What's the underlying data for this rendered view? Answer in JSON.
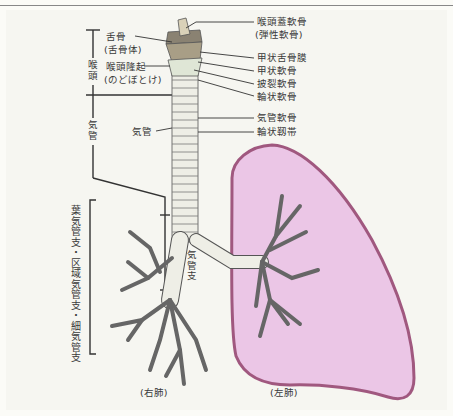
{
  "figure": {
    "colors": {
      "background": "#f6f6f1",
      "lung_fill": "#ebc6e6",
      "lung_outline": "#a0587f",
      "cartilage": "#f2f2ec",
      "cartilage_shade": "#c9c5b4",
      "line": "#333333"
    }
  },
  "labels": {
    "right_side": {
      "epiglottic_cartilage": "喉頭蓋軟骨",
      "epiglottic_cartilage_note": "(弾性軟骨)",
      "thyrohyoid_membrane": "甲状舌骨膜",
      "thyroid_cartilage": "甲状軟骨",
      "arytenoid_cartilage": "披裂軟骨",
      "cricoid_cartilage": "輪状軟骨",
      "tracheal_cartilage": "気管軟骨",
      "annular_ligament": "輪状靱帯"
    },
    "left_side": {
      "hyoid": "舌骨",
      "hyoid_note": "(舌骨体)",
      "laryngeal_prominence": "喉頭隆起",
      "laryngeal_prominence_note": "(のどぼとけ)",
      "trachea": "気管"
    },
    "brackets": {
      "larynx": "喉頭",
      "trachea": "気管",
      "bronchi": "葉気管支・区域気管支・細気管支"
    },
    "bronchus": "気管支",
    "right_lung": "(右肺)",
    "left_lung": "(左肺)"
  }
}
